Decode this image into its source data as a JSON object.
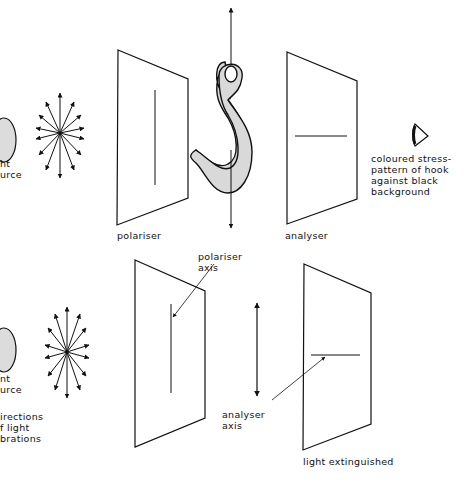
{
  "top": {
    "light_source_label": [
      "ht",
      "urce"
    ],
    "polariser_label": "polariser",
    "analyser_label": "analyser",
    "observer_note": [
      "coloured stress-",
      "pattern of hook",
      "against black",
      "background"
    ]
  },
  "bottom": {
    "light_source_label": [
      "nt",
      "urce"
    ],
    "vibrations_label": [
      "irections",
      "f light",
      "brations"
    ],
    "polariser_axis_label": [
      "polariser",
      "axis"
    ],
    "analyser_axis_label": [
      "analyser",
      "axis"
    ],
    "result_label": "light extinguished"
  },
  "colors": {
    "ink": "#111111",
    "hook_fill": "#d9d9d9",
    "source_fill": "#dcdcdc"
  }
}
